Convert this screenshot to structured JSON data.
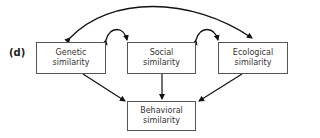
{
  "panel_label": "(d)",
  "nodes": {
    "genetic": {
      "line1": "Genetic",
      "line2": "similarity"
    },
    "social": {
      "line1": "Social",
      "line2": "similarity"
    },
    "ecological": {
      "line1": "Ecological",
      "line2": "similarity"
    },
    "behavioral": {
      "line1": "Behavioral",
      "line2": "similarity"
    }
  },
  "edges": [
    {
      "from": "genetic",
      "to": "ecological",
      "type": "bidirectional-curved"
    },
    {
      "from": "genetic",
      "to": "social",
      "type": "bidirectional-curved"
    },
    {
      "from": "social",
      "to": "ecological",
      "type": "bidirectional-curved"
    },
    {
      "from": "genetic",
      "to": "behavioral",
      "type": "directed"
    },
    {
      "from": "social",
      "to": "behavioral",
      "type": "directed"
    },
    {
      "from": "ecological",
      "to": "behavioral",
      "type": "directed"
    }
  ]
}
